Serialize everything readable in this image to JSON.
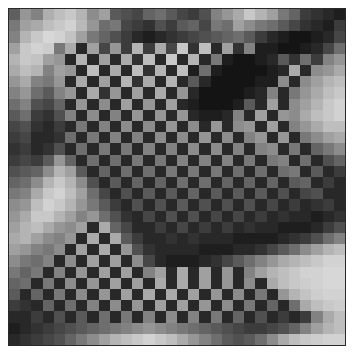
{
  "artwork": {
    "title": "",
    "grid": {
      "rows": 30,
      "cols": 30
    },
    "border_color": "#2a2a2a",
    "background_color": "#ffffff",
    "description": "Grayscale checkerboard mosaic modulated by wave-like light and dark bands",
    "gray_levels": [
      [
        95,
        150,
        130,
        175,
        190,
        200,
        180,
        140,
        160,
        90,
        80,
        70,
        100,
        110,
        90,
        70,
        60,
        80,
        130,
        150,
        170,
        200,
        180,
        160,
        120,
        100,
        60,
        50,
        40,
        30
      ],
      [
        120,
        160,
        170,
        190,
        200,
        210,
        185,
        150,
        110,
        120,
        70,
        60,
        50,
        80,
        60,
        90,
        100,
        70,
        120,
        110,
        160,
        140,
        120,
        110,
        90,
        70,
        50,
        40,
        30,
        60
      ],
      [
        130,
        180,
        200,
        215,
        210,
        195,
        160,
        120,
        100,
        80,
        60,
        40,
        30,
        40,
        50,
        60,
        70,
        80,
        90,
        100,
        110,
        90,
        60,
        40,
        30,
        20,
        20,
        30,
        40,
        70
      ],
      [
        160,
        200,
        210,
        205,
        120,
        170,
        40,
        160,
        70,
        150,
        60,
        180,
        60,
        170,
        70,
        200,
        50,
        190,
        40,
        160,
        50,
        130,
        30,
        30,
        20,
        20,
        30,
        40,
        70,
        110
      ],
      [
        180,
        200,
        195,
        160,
        150,
        40,
        180,
        40,
        160,
        40,
        170,
        50,
        190,
        40,
        200,
        40,
        180,
        40,
        120,
        30,
        20,
        20,
        30,
        40,
        90,
        50,
        110,
        60,
        130,
        150
      ],
      [
        170,
        190,
        180,
        130,
        160,
        150,
        40,
        190,
        40,
        170,
        40,
        190,
        50,
        180,
        40,
        190,
        30,
        110,
        30,
        20,
        20,
        20,
        20,
        30,
        40,
        170,
        40,
        140,
        150,
        170
      ],
      [
        150,
        170,
        130,
        120,
        150,
        40,
        170,
        40,
        160,
        40,
        180,
        50,
        170,
        40,
        180,
        40,
        90,
        40,
        20,
        20,
        20,
        20,
        30,
        30,
        140,
        40,
        140,
        160,
        180,
        190
      ],
      [
        130,
        150,
        110,
        90,
        130,
        150,
        40,
        170,
        50,
        150,
        40,
        160,
        40,
        170,
        40,
        150,
        40,
        20,
        20,
        20,
        20,
        30,
        40,
        130,
        40,
        120,
        150,
        170,
        190,
        200
      ],
      [
        110,
        130,
        80,
        70,
        100,
        40,
        150,
        40,
        140,
        40,
        160,
        40,
        150,
        40,
        160,
        40,
        30,
        20,
        20,
        20,
        30,
        90,
        40,
        160,
        40,
        140,
        160,
        180,
        200,
        210
      ],
      [
        90,
        110,
        60,
        50,
        80,
        130,
        40,
        140,
        40,
        130,
        40,
        150,
        40,
        150,
        40,
        150,
        40,
        30,
        30,
        40,
        130,
        40,
        160,
        40,
        150,
        140,
        170,
        190,
        200,
        210
      ],
      [
        70,
        80,
        50,
        40,
        60,
        40,
        120,
        40,
        130,
        40,
        140,
        40,
        140,
        40,
        150,
        40,
        140,
        40,
        150,
        40,
        140,
        150,
        40,
        160,
        40,
        130,
        150,
        170,
        190,
        190
      ],
      [
        60,
        70,
        40,
        40,
        50,
        110,
        40,
        120,
        40,
        130,
        40,
        130,
        40,
        140,
        40,
        140,
        40,
        150,
        40,
        140,
        40,
        130,
        150,
        40,
        150,
        40,
        120,
        140,
        160,
        170
      ],
      [
        50,
        60,
        40,
        50,
        80,
        40,
        110,
        40,
        120,
        40,
        120,
        40,
        130,
        40,
        130,
        40,
        140,
        40,
        140,
        40,
        130,
        40,
        130,
        140,
        40,
        120,
        40,
        100,
        120,
        140
      ],
      [
        60,
        70,
        60,
        90,
        150,
        100,
        40,
        110,
        40,
        110,
        40,
        120,
        40,
        120,
        40,
        130,
        40,
        130,
        40,
        130,
        40,
        120,
        40,
        120,
        130,
        40,
        110,
        40,
        80,
        100
      ],
      [
        80,
        90,
        100,
        140,
        180,
        160,
        90,
        40,
        100,
        40,
        110,
        40,
        110,
        40,
        120,
        40,
        120,
        40,
        120,
        40,
        110,
        40,
        110,
        40,
        110,
        120,
        40,
        90,
        40,
        60
      ],
      [
        100,
        110,
        140,
        180,
        200,
        180,
        140,
        80,
        40,
        90,
        40,
        100,
        40,
        100,
        40,
        110,
        40,
        110,
        40,
        100,
        40,
        100,
        40,
        100,
        40,
        90,
        100,
        40,
        60,
        40
      ],
      [
        120,
        130,
        170,
        200,
        210,
        190,
        160,
        110,
        70,
        40,
        80,
        40,
        90,
        40,
        90,
        40,
        100,
        40,
        90,
        40,
        90,
        40,
        90,
        40,
        80,
        40,
        70,
        80,
        40,
        40
      ],
      [
        140,
        150,
        190,
        210,
        200,
        180,
        150,
        120,
        90,
        60,
        40,
        80,
        40,
        80,
        40,
        90,
        40,
        80,
        40,
        80,
        40,
        80,
        40,
        70,
        40,
        60,
        40,
        50,
        60,
        40
      ],
      [
        150,
        170,
        200,
        200,
        180,
        160,
        130,
        150,
        110,
        80,
        50,
        40,
        70,
        40,
        80,
        40,
        80,
        40,
        70,
        40,
        70,
        40,
        60,
        40,
        50,
        40,
        40,
        30,
        40,
        50
      ],
      [
        160,
        180,
        190,
        170,
        150,
        140,
        160,
        40,
        170,
        100,
        70,
        40,
        40,
        60,
        40,
        70,
        40,
        60,
        40,
        60,
        40,
        50,
        40,
        40,
        30,
        30,
        30,
        40,
        60,
        80
      ],
      [
        170,
        180,
        160,
        140,
        130,
        150,
        40,
        170,
        40,
        170,
        90,
        60,
        40,
        40,
        50,
        40,
        50,
        40,
        40,
        40,
        30,
        30,
        30,
        30,
        40,
        50,
        60,
        80,
        110,
        130
      ],
      [
        160,
        150,
        130,
        120,
        140,
        40,
        160,
        40,
        170,
        40,
        150,
        80,
        50,
        40,
        40,
        40,
        40,
        30,
        30,
        30,
        40,
        40,
        50,
        70,
        90,
        110,
        140,
        160,
        180,
        190
      ],
      [
        140,
        120,
        110,
        130,
        40,
        140,
        40,
        160,
        40,
        160,
        40,
        140,
        70,
        40,
        30,
        30,
        30,
        40,
        50,
        70,
        90,
        110,
        130,
        150,
        170,
        180,
        190,
        200,
        210,
        210
      ],
      [
        120,
        100,
        120,
        40,
        130,
        40,
        150,
        40,
        160,
        40,
        160,
        40,
        130,
        160,
        40,
        170,
        40,
        160,
        40,
        150,
        40,
        130,
        160,
        180,
        190,
        200,
        210,
        210,
        215,
        215
      ],
      [
        100,
        110,
        40,
        120,
        40,
        140,
        40,
        150,
        40,
        160,
        40,
        160,
        40,
        170,
        40,
        170,
        40,
        160,
        40,
        150,
        40,
        140,
        40,
        170,
        190,
        200,
        205,
        210,
        215,
        215
      ],
      [
        90,
        40,
        100,
        40,
        120,
        40,
        140,
        40,
        150,
        40,
        160,
        40,
        170,
        40,
        170,
        40,
        160,
        40,
        150,
        40,
        140,
        40,
        120,
        40,
        150,
        180,
        195,
        205,
        210,
        210
      ],
      [
        60,
        50,
        40,
        100,
        40,
        110,
        40,
        130,
        40,
        140,
        40,
        150,
        40,
        160,
        40,
        160,
        40,
        150,
        40,
        140,
        40,
        120,
        40,
        100,
        40,
        110,
        170,
        190,
        200,
        205
      ],
      [
        40,
        40,
        60,
        40,
        80,
        40,
        90,
        40,
        110,
        40,
        120,
        40,
        130,
        40,
        140,
        40,
        130,
        40,
        120,
        40,
        100,
        40,
        80,
        40,
        60,
        40,
        60,
        130,
        170,
        190
      ],
      [
        30,
        40,
        50,
        60,
        70,
        80,
        90,
        100,
        110,
        120,
        130,
        140,
        150,
        140,
        130,
        120,
        110,
        100,
        90,
        80,
        70,
        60,
        60,
        70,
        80,
        100,
        130,
        160,
        180,
        190
      ],
      [
        40,
        50,
        60,
        70,
        80,
        100,
        120,
        140,
        160,
        180,
        190,
        200,
        210,
        200,
        190,
        170,
        150,
        130,
        110,
        90,
        80,
        90,
        110,
        140,
        170,
        190,
        200,
        205,
        210,
        210
      ]
    ]
  }
}
